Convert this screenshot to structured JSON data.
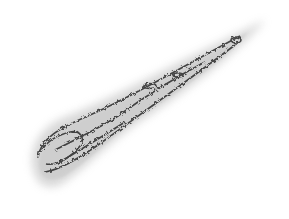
{
  "image": {
    "subject": "comet-like smudged texture sketch",
    "background": "#ffffff",
    "stroke_color": "#2a2a2a",
    "haze_color": "#9a9a9a"
  }
}
